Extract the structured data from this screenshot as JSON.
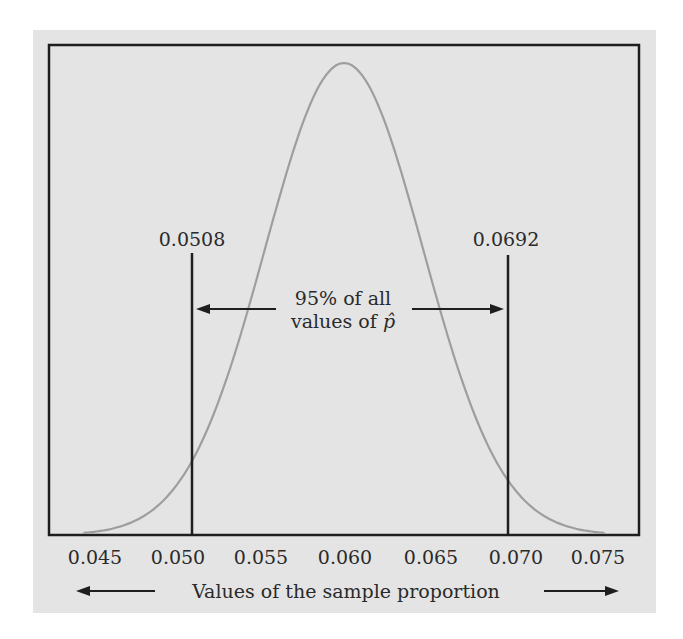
{
  "chart_data": {
    "type": "line",
    "title": "",
    "xlabel": "Values of the sample proportion",
    "ylabel": "",
    "xlim": [
      0.0425,
      0.0775
    ],
    "x_ticks": [
      "0.045",
      "0.050",
      "0.055",
      "0.060",
      "0.065",
      "0.070",
      "0.075"
    ],
    "grid": false,
    "legend": null,
    "series": [
      {
        "name": "Normal density of p-hat",
        "distribution": "normal",
        "mean": 0.06,
        "std": 0.0047,
        "color": "#9e9e9e"
      }
    ],
    "vertical_markers": [
      {
        "x": 0.0508,
        "label": "0.0508"
      },
      {
        "x": 0.0692,
        "label": "0.0692"
      }
    ],
    "annotations": [
      {
        "text_line1": "95% of all",
        "text_line2": "values of p̂",
        "arrows": "pointing to both markers"
      }
    ]
  },
  "labels": {
    "left_marker": "0.0508",
    "right_marker": "0.0692",
    "annotation_line1": "95% of all",
    "annotation_line2_prefix": "values of ",
    "annotation_line2_symbol": "p̂",
    "x_axis_title": "Values of the sample proportion",
    "ticks": [
      "0.045",
      "0.050",
      "0.055",
      "0.060",
      "0.065",
      "0.070",
      "0.075"
    ]
  },
  "colors": {
    "background": "#e4e4e4",
    "frame": "#1e1e1e",
    "curve": "#9e9e9e",
    "text": "#2a2a2a"
  }
}
